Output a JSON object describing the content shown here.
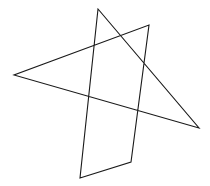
{
  "figure": {
    "width": 210,
    "height": 186,
    "background": "#ffffff",
    "stroke_color": "#1a1a1a",
    "stroke_width": 1.1,
    "shape": "self-intersecting closed polygon",
    "vertices": [
      [
        98,
        9
      ],
      [
        80,
        178
      ],
      [
        131,
        162
      ],
      [
        149,
        25
      ],
      [
        14,
        75
      ],
      [
        199,
        128
      ]
    ]
  }
}
